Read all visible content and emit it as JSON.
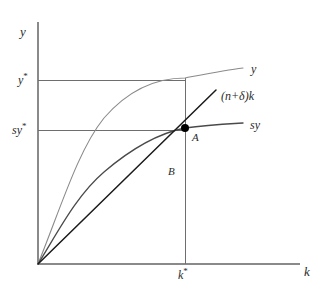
{
  "figure": {
    "kind": "solow-growth-model-diagram",
    "background_color": "#ffffff"
  },
  "axes": {
    "y_axis_label": "y",
    "x_axis_label": "k",
    "origin": {
      "x": 38,
      "y": 264
    },
    "x_axis_end": {
      "x": 300,
      "y": 264
    },
    "y_axis_top": {
      "x": 38,
      "y": 22
    },
    "axis_color": "#8a8a8a"
  },
  "ticks": {
    "y": [
      {
        "label": "y",
        "star": "*",
        "value_px": 80
      },
      {
        "label": "sy",
        "star": "*",
        "value_px": 130
      }
    ],
    "x": [
      {
        "label": "k",
        "star": "*",
        "value_px": 185
      }
    ]
  },
  "guides": {
    "color": "#6e6e6e",
    "y_star_line": {
      "x1": 38,
      "y1": 80,
      "x2": 185,
      "y2": 80
    },
    "sy_star_line": {
      "x1": 38,
      "y1": 130,
      "x2": 185,
      "y2": 130
    },
    "k_star_line": {
      "x1": 185,
      "y1": 78,
      "x2": 185,
      "y2": 264
    }
  },
  "curves": [
    {
      "name": "output-per-worker",
      "label": "y",
      "color": "#8a8a8a",
      "width": 1.1,
      "label_pos": {
        "x": 251,
        "y": 63
      },
      "path": "M 38 264 C 60 210, 78 150, 104 118 C 130 88, 158 78, 185 78 C 206 74, 226 70, 243 68"
    },
    {
      "name": "saving-per-worker",
      "label": "sy",
      "color": "#4a4a4a",
      "width": 1.3,
      "label_pos": {
        "x": 250,
        "y": 119
      },
      "path": "M 38 264 C 58 232, 76 196, 104 172 C 132 148, 160 133, 185 128 C 206 125, 226 124, 243 123"
    },
    {
      "name": "break-even-investment",
      "label": "(n+δ)k",
      "color": "#1a1a1a",
      "width": 1.5,
      "label_pos": {
        "x": 221,
        "y": 90
      },
      "path": "M 38 264 L 216 90"
    }
  ],
  "points": [
    {
      "name": "steady-state-point",
      "label": "A",
      "x": 185,
      "y": 128,
      "radius": 4,
      "color": "#000000",
      "label_pos": {
        "x": 192,
        "y": 132
      }
    }
  ],
  "annotations": [
    {
      "name": "consumption-gap-label",
      "label": "B",
      "pos": {
        "x": 168,
        "y": 166
      }
    }
  ]
}
